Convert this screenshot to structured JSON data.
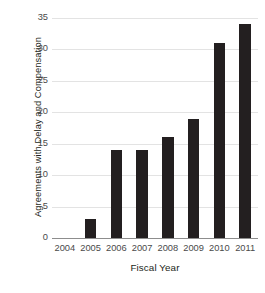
{
  "chart_data": {
    "type": "bar",
    "title": "",
    "subtitle": "",
    "xlabel": "Fiscal Year",
    "ylabel": "Agreements with Delay and Compensation",
    "categories": [
      "2004",
      "2005",
      "2006",
      "2007",
      "2008",
      "2009",
      "2010",
      "2011"
    ],
    "values": [
      0,
      3,
      14,
      14,
      16,
      19,
      31,
      34
    ],
    "series": [
      {
        "name": "Agreements with Delay and Compensation",
        "values": [
          0,
          3,
          14,
          14,
          16,
          19,
          31,
          34
        ]
      }
    ],
    "ylim": [
      0,
      35
    ],
    "xlim_categories": 8,
    "yticks": [
      0,
      5,
      10,
      15,
      20,
      25,
      30,
      35
    ],
    "ytick_labels": [
      "0",
      "5",
      "10",
      "15",
      "20",
      "25",
      "30",
      "35"
    ],
    "xtick_labels": [
      "2004",
      "2005",
      "2006",
      "2007",
      "2008",
      "2009",
      "2010",
      "2011"
    ],
    "grid": true,
    "grid_axis": "y",
    "legend": false,
    "legend_position": "none",
    "annotations": [],
    "colors": {
      "bar": "#231f20",
      "gridline": "#e3e3e3",
      "axis_line": "#8d8d8d",
      "tick_label": "#4a4a4a",
      "axis_title": "#231f20",
      "background": "#ffffff"
    },
    "bar_width_ratio": 0.45
  }
}
